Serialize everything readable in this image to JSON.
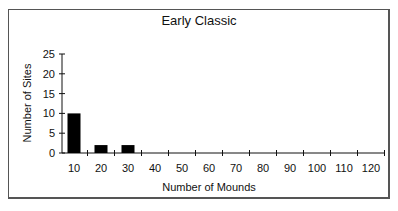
{
  "chart_data": {
    "type": "bar",
    "title": "Early Classic",
    "xlabel": "Number of Mounds",
    "ylabel": "Number of Sites",
    "categories": [
      "10",
      "20",
      "30",
      "40",
      "50",
      "60",
      "70",
      "80",
      "90",
      "100",
      "110",
      "120"
    ],
    "values": [
      10,
      2,
      2,
      0,
      0,
      0,
      0,
      0,
      0,
      0,
      0,
      0
    ],
    "ylim": [
      0,
      25
    ],
    "yticks": [
      0,
      5,
      10,
      15,
      20,
      25
    ],
    "grid": false,
    "legend": null,
    "bar_color": "#000000"
  }
}
